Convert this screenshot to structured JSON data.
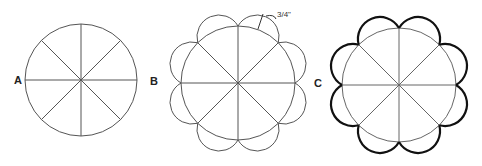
{
  "figure": {
    "panels": [
      {
        "label": "A",
        "description": "Circle divided into 8 equal sections"
      },
      {
        "label": "B",
        "description": "Circle with 8 semicircular petals drawn on each segment"
      },
      {
        "label": "C",
        "description": "Scalloped outline traced in bold around the petals"
      }
    ],
    "dimension_label": "3/4\"",
    "colors": {
      "line": "#555555",
      "bold": "#111111",
      "background": "#ffffff"
    }
  }
}
